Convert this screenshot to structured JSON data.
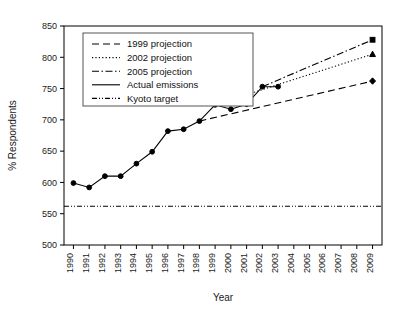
{
  "chart_data": {
    "type": "line",
    "title": "",
    "xlabel": "Year",
    "ylabel": "% Respondents",
    "xlim": [
      1989.4,
      2009.6
    ],
    "ylim": [
      500,
      850
    ],
    "ytick_values": [
      500,
      550,
      600,
      650,
      700,
      750,
      800,
      850
    ],
    "ytick_labels": [
      "500",
      "550",
      "600",
      "650",
      "700",
      "750",
      "800",
      "850"
    ],
    "xtick_values": [
      1990,
      1991,
      1992,
      1993,
      1994,
      1995,
      1996,
      1997,
      1998,
      1999,
      2000,
      2001,
      2002,
      2003,
      2004,
      2005,
      2006,
      2007,
      2008,
      2009
    ],
    "xtick_labels": [
      "1990",
      "1991",
      "1992",
      "1993",
      "1994",
      "1995",
      "1996",
      "1997",
      "1998",
      "1999",
      "2000",
      "2001",
      "2002",
      "2003",
      "2004",
      "2005",
      "2006",
      "2007",
      "2008",
      "2009"
    ],
    "grid": false,
    "legend_position": "upper-left",
    "series": [
      {
        "name": "1999 projection",
        "style": "dashed",
        "marker": "diamond",
        "x": [
          1998,
          2009
        ],
        "values": [
          698,
          762
        ]
      },
      {
        "name": "2002 projection",
        "style": "dotted",
        "marker": "triangle",
        "x": [
          1999,
          2009
        ],
        "values": [
          724,
          805
        ]
      },
      {
        "name": "2005 projection",
        "style": "dashdot",
        "marker": "square",
        "x": [
          2002,
          2009
        ],
        "values": [
          753,
          828
        ]
      },
      {
        "name": "Actual emissions",
        "style": "solid",
        "marker": "circle",
        "x": [
          1990,
          1991,
          1992,
          1993,
          1994,
          1995,
          1996,
          1997,
          1998,
          1999,
          2000,
          2001,
          2002,
          2003
        ],
        "values": [
          599,
          592,
          610,
          610,
          630,
          649,
          682,
          685,
          698,
          724,
          717,
          725,
          753,
          753
        ]
      },
      {
        "name": "Kyoto target",
        "style": "dashdotdot",
        "marker": "none",
        "x": [
          1989.4,
          2009.6
        ],
        "values": [
          562,
          562
        ]
      }
    ]
  },
  "legend": {
    "items": [
      {
        "label": "1999 projection",
        "style": "dashed"
      },
      {
        "label": "2002 projection",
        "style": "dotted"
      },
      {
        "label": "2005 projection",
        "style": "dashdot"
      },
      {
        "label": "Actual emissions",
        "style": "solid"
      },
      {
        "label": "Kyoto target",
        "style": "dashdotdot"
      }
    ]
  },
  "colors": {
    "foreground": "#000000",
    "background": "#ffffff",
    "text": "#1a1a1a",
    "legend_border": "#555555"
  }
}
